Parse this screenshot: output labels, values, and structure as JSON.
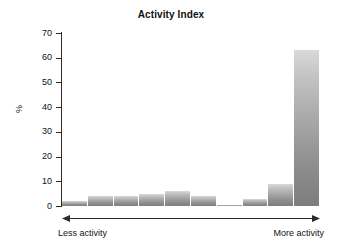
{
  "chart_data": {
    "type": "bar",
    "title": "Activity Index",
    "xlabel": "",
    "ylabel": "%",
    "ylim": [
      0,
      70
    ],
    "yticks": [
      0,
      10,
      20,
      30,
      40,
      50,
      60,
      70
    ],
    "grid": false,
    "legend": null,
    "x_axis_annotation": {
      "style": "double-headed-arrow",
      "left_label": "Less activity",
      "right_label": "More activity"
    },
    "categories": [
      "1",
      "2",
      "3",
      "4",
      "5",
      "6",
      "7",
      "8",
      "9",
      "10"
    ],
    "values": [
      2,
      4,
      4,
      5,
      6,
      4,
      0.5,
      3,
      9,
      63
    ],
    "bar_fill": "grayscale-vertical-gradient",
    "colors": {
      "bar_top": "#d9d9d9",
      "bar_bottom": "#7d7d7d",
      "axis": "#2b2b2b",
      "text": "#111111",
      "background": "#ffffff"
    }
  },
  "axis": {
    "y_label": "%",
    "y_tick_labels": [
      "70",
      "60",
      "50",
      "40",
      "30",
      "20",
      "10",
      "0"
    ]
  },
  "title": {
    "text": "Activity Index"
  },
  "footer": {
    "left_label": "Less activity",
    "right_label": "More activity"
  }
}
